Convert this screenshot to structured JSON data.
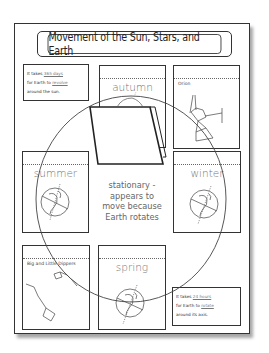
{
  "title": "Movement of the Sun, Stars, and Earth",
  "cards": {
    "autumn": {
      "label": "autumn"
    },
    "orion": {
      "label": "Orion"
    },
    "summer": {
      "label": "summer"
    },
    "winter": {
      "label": "winter"
    },
    "dippers": {
      "label": "Big and Little Dippers"
    },
    "spring": {
      "label": "spring"
    }
  },
  "info_top": {
    "line1_prefix": "It takes",
    "line1_fill": "365 days",
    "line2_prefix": "for Earth to",
    "line2_fill": "revolve",
    "line3": "around the sun."
  },
  "info_bottom": {
    "line1_prefix": "It takes",
    "line1_fill": "24 hours",
    "line2_prefix": "for Earth to",
    "line2_fill": "rotate",
    "line3": "around its axis."
  },
  "center": {
    "line1": "stationary -",
    "line2": "appears to",
    "line3": "move because",
    "line4": "Earth rotates"
  },
  "colors": {
    "border": "#333333",
    "label_gray": "#777777"
  }
}
